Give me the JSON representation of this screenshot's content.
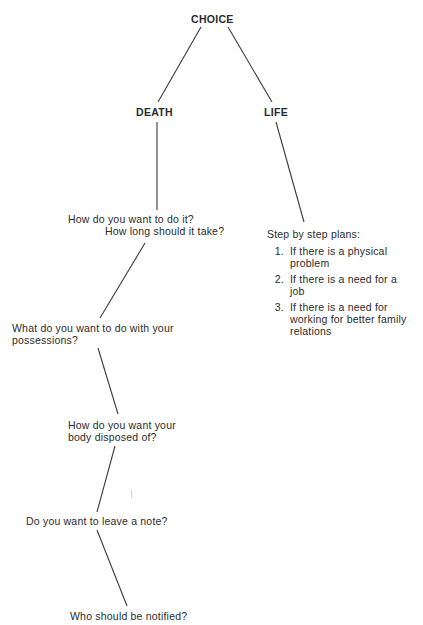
{
  "diagram": {
    "root": "CHOICE",
    "branches": {
      "death": {
        "label": "DEATH",
        "steps": [
          {
            "line1": "How do you want to do it?",
            "line2": "How long should it take?"
          },
          {
            "line1": "What do you want to do with your",
            "line2": "possessions?"
          },
          {
            "line1": "How do you want your",
            "line2": "body disposed of?"
          },
          {
            "line1": "Do you want to leave a note?"
          },
          {
            "line1": "Who should be notified?"
          }
        ]
      },
      "life": {
        "label": "LIFE",
        "plans_heading": "Step by step plans:",
        "plans": [
          {
            "num": "1.",
            "text": "If there is a physical problem"
          },
          {
            "num": "2.",
            "text": "If there is a need for a job"
          },
          {
            "num": "3.",
            "text": "If there is a need for working for better family relations"
          }
        ]
      }
    }
  }
}
